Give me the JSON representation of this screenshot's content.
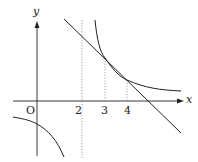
{
  "diagram": {
    "type": "function-graph",
    "axes": {
      "x_label": "x",
      "y_label": "y",
      "origin_label": "O"
    },
    "tick_labels": [
      "2",
      "3",
      "4"
    ],
    "asymptote": {
      "x": 2,
      "style": "dotted"
    },
    "intersection_guides": [
      {
        "x": 3,
        "style": "dotted"
      },
      {
        "x": 4,
        "style": "dotted"
      }
    ],
    "curves": [
      {
        "name": "hyperbola-right-branch",
        "description": "decreasing curve right of x=2"
      },
      {
        "name": "hyperbola-left-branch",
        "description": "decreasing curve left of x=2, below x-axis"
      },
      {
        "name": "line",
        "description": "straight line with negative slope meeting the curve at x=3 and x=4"
      }
    ],
    "colors": {
      "stroke": "#222222",
      "guide": "#888888",
      "background": "#ffffff"
    }
  }
}
